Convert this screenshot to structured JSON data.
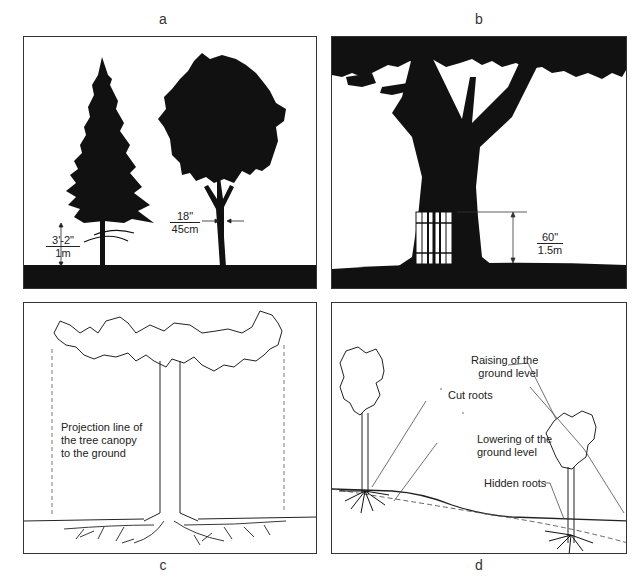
{
  "figure": {
    "panels": [
      {
        "id": "a",
        "label": "a",
        "subject": "Conifer and deciduous tree silhouettes with measurement markers",
        "annotations": {
          "height_marker": {
            "top": "3'-2\"",
            "bottom": "1m"
          },
          "trunk_width_marker": {
            "top": "18\"",
            "bottom": "45cm"
          }
        }
      },
      {
        "id": "b",
        "label": "b",
        "subject": "Tree trunk protected by a wooden slat guard",
        "annotations": {
          "guard_height_marker": {
            "top": "60\"",
            "bottom": "1.5m"
          }
        }
      },
      {
        "id": "c",
        "label": "c",
        "subject": "Tree canopy drip line projected to the ground with root spread",
        "annotations": {
          "projection_note": [
            "Projection line of",
            "the tree canopy",
            "to the ground"
          ]
        }
      },
      {
        "id": "d",
        "label": "d",
        "subject": "Changes in ground level around trees",
        "annotations": {
          "raising": [
            "Raising of the",
            "ground level"
          ],
          "cut_roots": "Cut roots",
          "lowering": [
            "Lowering of the",
            "ground level"
          ],
          "hidden_roots": "Hidden roots"
        }
      }
    ],
    "colors": {
      "silhouette": "#111111",
      "line": "#222222",
      "border": "#333333",
      "background": "#ffffff"
    }
  }
}
